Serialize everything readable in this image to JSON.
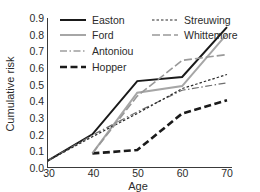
{
  "chart_data": {
    "type": "line",
    "title": "",
    "xlabel": "Age",
    "ylabel": "Cumulative risk",
    "x": [
      30,
      40,
      50,
      60,
      70
    ],
    "xlim": [
      30,
      70
    ],
    "ylim": [
      0.0,
      0.9
    ],
    "grid": false,
    "legend_position": "top",
    "xticks": [
      "30",
      "40",
      "50",
      "60",
      "70"
    ],
    "yticks": [
      "0.0",
      "0.1",
      "0.2",
      "0.3",
      "0.4",
      "0.5",
      "0.6",
      "0.7",
      "0.8",
      "0.9"
    ],
    "series": [
      {
        "name": "Easton",
        "color": "#1a1a1a",
        "style": "solid",
        "width": 2.0,
        "dash": "",
        "x": [
          30,
          40,
          50,
          60,
          70
        ],
        "values": [
          0.04,
          0.2,
          0.52,
          0.545,
          0.845
        ]
      },
      {
        "name": "Ford",
        "color": "#a6a6a6",
        "style": "solid",
        "width": 2.0,
        "dash": "",
        "x": [
          40,
          50,
          60,
          70
        ],
        "values": [
          0.085,
          0.45,
          0.49,
          0.805
        ]
      },
      {
        "name": "Antoniou",
        "color": "#6e6e6e",
        "style": "dash-dot",
        "width": 1.2,
        "dash": "7,2.5,1.5,2.5",
        "x": [
          30,
          40,
          50,
          60,
          70
        ],
        "values": [
          0.04,
          0.195,
          0.335,
          0.465,
          0.51
        ]
      },
      {
        "name": "Hopper",
        "color": "#1a1a1a",
        "style": "dashed-thick",
        "width": 2.6,
        "dash": "7,3.5",
        "x": [
          40,
          50,
          60,
          70
        ],
        "values": [
          0.085,
          0.105,
          0.325,
          0.405
        ]
      },
      {
        "name": "Streuwing",
        "color": "#2b2b2b",
        "style": "dotted",
        "width": 1.2,
        "dash": "2.5,2",
        "x": [
          30,
          40,
          50,
          60,
          70
        ],
        "values": [
          0.04,
          0.185,
          0.325,
          0.475,
          0.56
        ]
      },
      {
        "name": "Whittemore",
        "color": "#999999",
        "style": "dashed",
        "width": 1.6,
        "dash": "8,3",
        "x": [
          40,
          50,
          60,
          70
        ],
        "values": [
          0.085,
          0.43,
          0.645,
          0.68
        ]
      }
    ]
  },
  "axes": {
    "ylabel": "Cumulative risk",
    "xlabel": "Age",
    "yticks": [
      "0.9",
      "0.8",
      "0.7",
      "0.6",
      "0.5",
      "0.4",
      "0.3",
      "0.2",
      "0.1",
      "0.0"
    ],
    "xticks": [
      "30",
      "40",
      "50",
      "60",
      "70"
    ]
  },
  "legend": {
    "column_left": [
      "Easton",
      "Ford",
      "Antoniou",
      "Hopper"
    ],
    "column_right": [
      "Streuwing",
      "Whittemore"
    ],
    "entries": [
      {
        "label": "Easton",
        "swatch": "legend-swatch-easton"
      },
      {
        "label": "Streuwing",
        "swatch": "legend-swatch-streuwing"
      },
      {
        "label": "Ford",
        "swatch": "legend-swatch-ford"
      },
      {
        "label": "Whittemore",
        "swatch": "legend-swatch-whittemore"
      },
      {
        "label": "Antoniou",
        "swatch": "legend-swatch-antoniou"
      },
      {
        "label": "Hopper",
        "swatch": "legend-swatch-hopper"
      }
    ]
  }
}
